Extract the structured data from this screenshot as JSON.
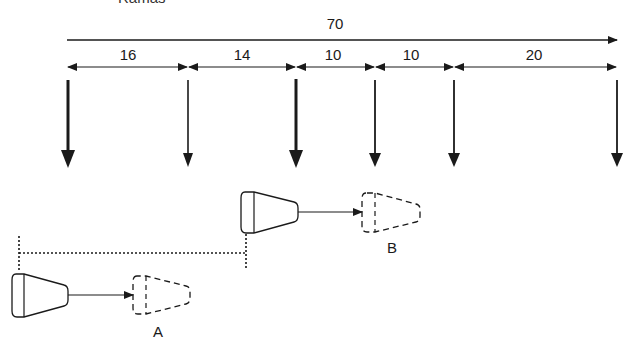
{
  "title_clipped": "Ramas",
  "total": {
    "label": "70",
    "x_start": 67,
    "x_end": 617,
    "y": 40
  },
  "segments": [
    {
      "label": "16",
      "x1": 68,
      "x2": 188
    },
    {
      "label": "14",
      "x1": 188,
      "x2": 296
    },
    {
      "label": "10",
      "x1": 296,
      "x2": 375
    },
    {
      "label": "10",
      "x1": 375,
      "x2": 454
    },
    {
      "label": "20",
      "x1": 454,
      "x2": 617
    }
  ],
  "down_arrows": [
    {
      "x": 68,
      "weight": "thick"
    },
    {
      "x": 188,
      "weight": "thin"
    },
    {
      "x": 296,
      "weight": "thick"
    },
    {
      "x": 375,
      "weight": "thin"
    },
    {
      "x": 454,
      "weight": "thin"
    },
    {
      "x": 617,
      "weight": "thin"
    }
  ],
  "positions": [
    {
      "label": "A"
    },
    {
      "label": "B"
    }
  ],
  "colors": {
    "line": "#1a1a1a",
    "background": "#ffffff"
  }
}
